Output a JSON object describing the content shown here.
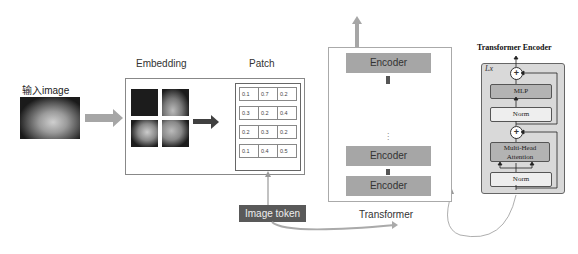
{
  "diagram": {
    "input": {
      "label": "输入image"
    },
    "embedding": {
      "label": "Embedding"
    },
    "patch": {
      "label": "Patch",
      "rows": [
        [
          "0.1",
          "0.7",
          "0.2"
        ],
        [
          "0.3",
          "0.2",
          "0.4"
        ],
        [
          "0.2",
          "0.3",
          "0.2"
        ],
        [
          "0.1",
          "0.4",
          "0.5"
        ]
      ]
    },
    "image_token": {
      "label": "Image token"
    },
    "transformer": {
      "label": "Transformer",
      "encoders": [
        "Encoder",
        "Encoder",
        "Encoder"
      ],
      "ellipsis": "⋮"
    },
    "transformer_encoder": {
      "title": "Transformer Encoder",
      "repeat": "Lx",
      "blocks": {
        "mlp": "MLP",
        "norm_top": "Norm",
        "attention_line1": "Multi-Head",
        "attention_line2": "Attention",
        "norm_bottom": "Norm"
      },
      "plus": "+"
    },
    "colors": {
      "arrow_gray": "#a6a6a6",
      "dark_arrow": "#404040",
      "token_bg": "#595959",
      "encoder_bg": "#a6a6a6",
      "te_bg": "#d9d9d9",
      "te_mlp": "#b3b3b3",
      "te_norm": "#eeeeee"
    }
  }
}
